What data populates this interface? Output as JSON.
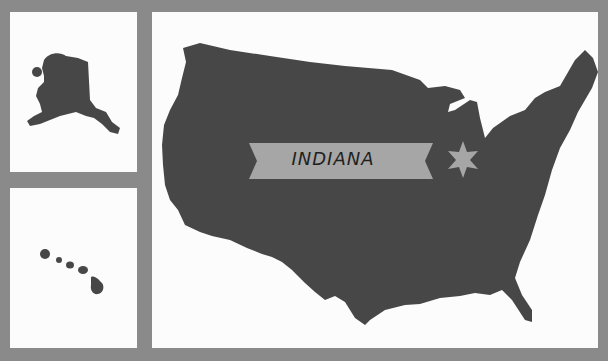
{
  "map": {
    "title": "United States",
    "highlighted_state": "INDIANA",
    "marker_icon": "star-icon",
    "insets": [
      "Alaska",
      "Hawaii"
    ],
    "colors": {
      "background": "#8a8a8a",
      "panel": "#fcfcfc",
      "land": "#474747",
      "banner": "#a6a6a6",
      "text": "#1f1f1f"
    }
  }
}
